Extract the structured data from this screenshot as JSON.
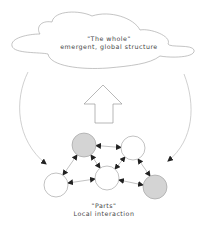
{
  "whole": {
    "title": "\"The whole\"",
    "subtitle": "emergent, global structure"
  },
  "parts": {
    "title": "\"Parts\"",
    "subtitle": "Local interaction"
  },
  "nodes": [
    {
      "id": "n1",
      "cx": 84,
      "cy": 145,
      "fill": "#d4d4d4"
    },
    {
      "id": "n2",
      "cx": 133,
      "cy": 148,
      "fill": "#ffffff"
    },
    {
      "id": "n3",
      "cx": 56,
      "cy": 185,
      "fill": "#ffffff"
    },
    {
      "id": "n4",
      "cx": 107,
      "cy": 178,
      "fill": "#ffffff"
    },
    {
      "id": "n5",
      "cx": 155,
      "cy": 187,
      "fill": "#d4d4d4"
    }
  ],
  "colors": {
    "stroke": "#9a9a9a",
    "arrowhead": "#222222",
    "gray_node": "#d4d4d4"
  }
}
